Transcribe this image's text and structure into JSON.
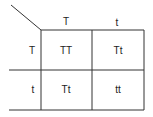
{
  "diagram": {
    "type": "punnett-square",
    "column_headers": [
      "T",
      "t"
    ],
    "row_headers": [
      "T",
      "t"
    ],
    "cells": [
      [
        "TT",
        "Tt"
      ],
      [
        "Tt",
        "tt"
      ]
    ],
    "line_color": "#333333"
  }
}
